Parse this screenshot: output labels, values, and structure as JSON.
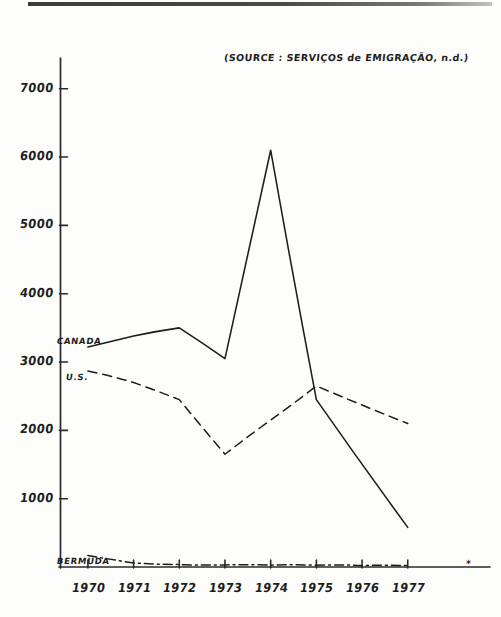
{
  "chart_data": {
    "type": "line",
    "title": "",
    "subtitle": "",
    "source_note": "(SOURCE : SERVIÇOS de EMIGRAÇÃO, n.d.)",
    "xlabel": "",
    "ylabel": "",
    "x": [
      1970,
      1971,
      1972,
      1973,
      1974,
      1975,
      1976,
      1977
    ],
    "xtick_labels": [
      "1970",
      "1971",
      "1972",
      "1973",
      "1974",
      "1975",
      "1976",
      "1977"
    ],
    "ytick_labels": [
      "1000",
      "2000",
      "3000",
      "4000",
      "5000",
      "6000",
      "7000"
    ],
    "ytick_values": [
      1000,
      2000,
      3000,
      4000,
      5000,
      6000,
      7000
    ],
    "ylim": [
      0,
      7450
    ],
    "xlim": [
      1969.4,
      1978.1
    ],
    "grid": false,
    "legend_position": "inline-left-labels",
    "axis_end_mark": "*",
    "series": [
      {
        "name": "CANADA",
        "style": "solid",
        "label_x": 1970,
        "label_y": 3220,
        "x": [
          1970,
          1971,
          1972,
          1973,
          1974,
          1975,
          1977
        ],
        "values": [
          3220,
          3380,
          3500,
          3050,
          6100,
          2450,
          580
        ]
      },
      {
        "name": "U.S.",
        "style": "dashed",
        "label_x": 1970,
        "label_y": 2870,
        "x": [
          1970,
          1971,
          1972,
          1973,
          1974,
          1975,
          1977
        ],
        "values": [
          2870,
          2700,
          2450,
          1650,
          2150,
          2650,
          2100
        ]
      },
      {
        "name": "BERMUDA",
        "style": "dash-dot",
        "label_x": 1970,
        "label_y": 170,
        "x": [
          1970,
          1971,
          1972,
          1973,
          1974,
          1975,
          1976,
          1977
        ],
        "values": [
          170,
          60,
          35,
          30,
          28,
          25,
          22,
          20
        ]
      }
    ]
  },
  "colors": {
    "ink": "#1d1d1d",
    "paper": "#fdfdfc",
    "axis": "#2a2a2a"
  }
}
